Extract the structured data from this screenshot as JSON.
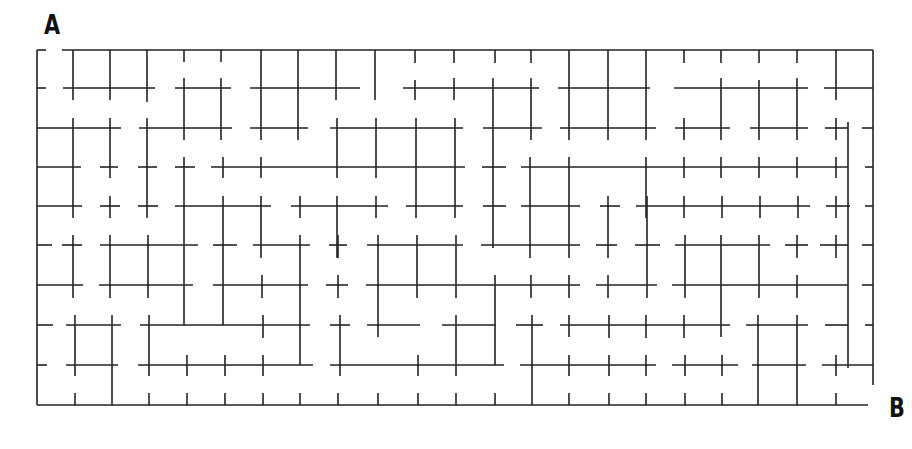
{
  "puzzle": {
    "type": "maze",
    "start_label": "A",
    "end_label": "B",
    "colors": {
      "background": "#ffffff",
      "walls": "#222222",
      "labels": "#111111"
    },
    "grid": {
      "columns": 22,
      "rows": 9
    }
  }
}
